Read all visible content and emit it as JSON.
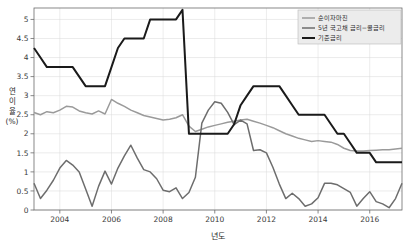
{
  "chart_data": {
    "type": "line",
    "title": "",
    "xlabel": "년도",
    "ylabel": "연 이 율 (%)",
    "ylabel_chars": [
      "연",
      "이",
      "율",
      "(%)"
    ],
    "xlim": [
      2003.0,
      2017.25
    ],
    "ylim": [
      0,
      5.3
    ],
    "yticks": [
      0,
      0.5,
      1,
      1.5,
      2,
      2.5,
      3,
      3.5,
      4,
      4.5,
      5
    ],
    "ytick_labels": [
      "0",
      "0.5",
      "1",
      "1.5",
      "2",
      "2.5",
      "3",
      "3.5",
      "4",
      "4.5",
      "5"
    ],
    "xticks": [
      2004,
      2006,
      2008,
      2010,
      2012,
      2014,
      2016
    ],
    "xtick_labels": [
      "2004",
      "2006",
      "2008",
      "2010",
      "2012",
      "2014",
      "2016"
    ],
    "grid": true,
    "legend_position": "top-right",
    "x": [
      2003.0,
      2003.25,
      2003.5,
      2003.75,
      2004.0,
      2004.25,
      2004.5,
      2004.75,
      2005.0,
      2005.25,
      2005.5,
      2005.75,
      2006.0,
      2006.25,
      2006.5,
      2006.75,
      2007.0,
      2007.25,
      2007.5,
      2007.75,
      2008.0,
      2008.25,
      2008.5,
      2008.75,
      2009.0,
      2009.25,
      2009.5,
      2009.75,
      2010.0,
      2010.25,
      2010.5,
      2010.75,
      2011.0,
      2011.25,
      2011.5,
      2011.75,
      2012.0,
      2012.25,
      2012.5,
      2012.75,
      2013.0,
      2013.25,
      2013.5,
      2013.75,
      2014.0,
      2014.25,
      2014.5,
      2014.75,
      2015.0,
      2015.25,
      2015.5,
      2015.75,
      2016.0,
      2016.25,
      2016.5,
      2016.75,
      2017.0,
      2017.25
    ],
    "series": [
      {
        "name": "순이자마진",
        "color": "#9a9a9a",
        "width": 1.5,
        "values": [
          2.56,
          2.5,
          2.58,
          2.55,
          2.62,
          2.72,
          2.7,
          2.6,
          2.55,
          2.52,
          2.6,
          2.52,
          2.9,
          2.8,
          2.72,
          2.62,
          2.55,
          2.48,
          2.44,
          2.4,
          2.36,
          2.38,
          2.42,
          2.5,
          2.2,
          2.06,
          2.12,
          2.18,
          2.22,
          2.26,
          2.3,
          2.33,
          2.36,
          2.38,
          2.33,
          2.28,
          2.22,
          2.16,
          2.08,
          2.0,
          1.94,
          1.88,
          1.84,
          1.8,
          1.82,
          1.8,
          1.78,
          1.72,
          1.62,
          1.56,
          1.55,
          1.55,
          1.56,
          1.57,
          1.58,
          1.58,
          1.6,
          1.62
        ]
      },
      {
        "name": "5년 국고채 금리−콜금리",
        "color": "#6d6d6d",
        "width": 1.5,
        "values": [
          0.7,
          0.3,
          0.52,
          0.78,
          1.1,
          1.3,
          1.18,
          1.0,
          0.55,
          0.1,
          0.62,
          1.02,
          0.68,
          1.1,
          1.42,
          1.7,
          1.36,
          1.06,
          1.0,
          0.82,
          0.52,
          0.48,
          0.58,
          0.3,
          0.46,
          0.86,
          2.28,
          2.62,
          2.84,
          2.8,
          2.56,
          2.24,
          2.36,
          2.26,
          1.56,
          1.58,
          1.5,
          1.12,
          0.68,
          0.3,
          0.44,
          0.3,
          0.1,
          0.16,
          0.32,
          0.7,
          0.7,
          0.66,
          0.56,
          0.46,
          0.1,
          0.3,
          0.48,
          0.22,
          0.16,
          0.06,
          0.3,
          0.7
        ]
      },
      {
        "name": "기준금리",
        "color": "#1a1a1a",
        "width": 2.0,
        "values": [
          4.25,
          4.0,
          3.75,
          3.75,
          3.75,
          3.75,
          3.75,
          3.5,
          3.25,
          3.25,
          3.25,
          3.25,
          3.75,
          4.25,
          4.5,
          4.5,
          4.5,
          4.5,
          5.0,
          5.0,
          5.0,
          5.0,
          5.0,
          5.25,
          2.0,
          2.0,
          2.0,
          2.0,
          2.0,
          2.0,
          2.0,
          2.25,
          2.75,
          3.0,
          3.25,
          3.25,
          3.25,
          3.25,
          3.25,
          3.0,
          2.75,
          2.5,
          2.5,
          2.5,
          2.5,
          2.5,
          2.25,
          2.0,
          2.0,
          1.75,
          1.5,
          1.5,
          1.5,
          1.25,
          1.25,
          1.25,
          1.25,
          1.25
        ]
      }
    ]
  }
}
